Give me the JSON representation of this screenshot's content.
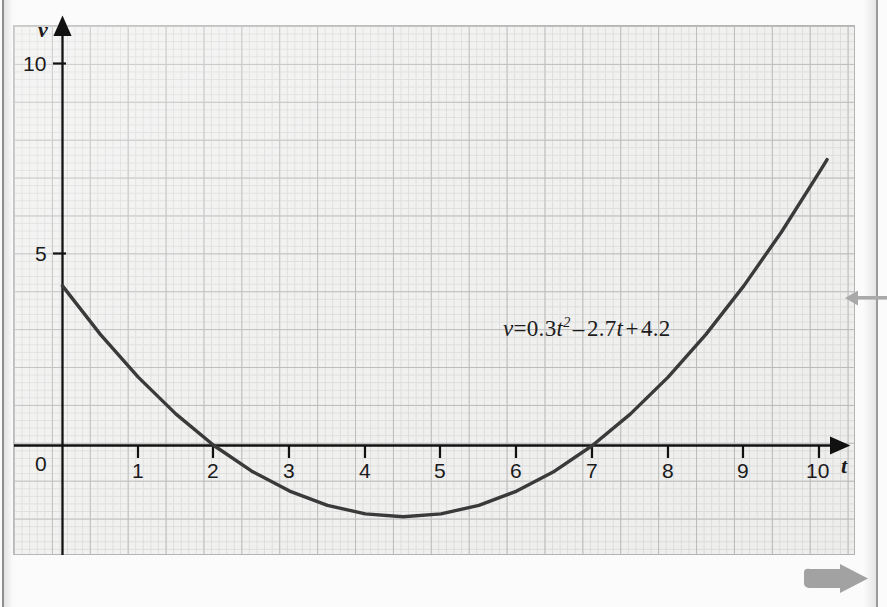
{
  "page": {
    "background_color": "#fbfbfb",
    "grid_color_major": "#bdbdbd",
    "grid_color_minor": "#dedede",
    "grid_background": "#f1f1f0",
    "curve_color": "#3a3a3a",
    "axis_color": "#111111",
    "marginal_arrow_color": "#a8a8a8"
  },
  "figure": {
    "equation_label": {
      "lhs": "v",
      "equals": "=",
      "term1_coeff": "0.3",
      "term1_var": "t",
      "term1_exp": "2",
      "op1": "–",
      "term2": "2.7",
      "term2_var": "t",
      "op2": "+",
      "term3": "4.2",
      "plain": "v = 0.3t² – 2.7t + 4.2"
    },
    "y_axis_name": "v",
    "x_axis_name": "t",
    "y_tick_labels": [
      "10",
      "5",
      "0"
    ],
    "x_tick_labels": [
      "1",
      "2",
      "3",
      "4",
      "5",
      "6",
      "7",
      "8",
      "9",
      "10"
    ],
    "origin_label": "0"
  },
  "chart_data": {
    "type": "line",
    "title": "",
    "subtitle": "",
    "xlabel": "t",
    "ylabel": "v",
    "grid": true,
    "legend": false,
    "annotations": [
      "v = 0.3t² – 2.7t + 4.2"
    ],
    "xlim": [
      -0.3,
      10.6
    ],
    "ylim": [
      -3.2,
      10.9
    ],
    "xticks": [
      0,
      1,
      2,
      3,
      4,
      5,
      6,
      7,
      8,
      9,
      10
    ],
    "yticks": [
      0,
      5,
      10
    ],
    "equation": "v = 0.3*t^2 - 2.7*t + 4.2",
    "roots": [
      2,
      7
    ],
    "vertex": {
      "t": 4.5,
      "v": -1.875
    },
    "y_intercept": 4.2,
    "x": [
      0,
      0.5,
      1,
      1.5,
      2,
      2.5,
      3,
      3.5,
      4,
      4.5,
      5,
      5.5,
      6,
      6.5,
      7,
      7.5,
      8,
      8.5,
      9,
      9.5,
      10,
      10.1
    ],
    "values": [
      4.2,
      2.925,
      1.8,
      0.825,
      0,
      -0.675,
      -1.2,
      -1.575,
      -1.8,
      -1.875,
      -1.8,
      -1.575,
      -1.2,
      -0.675,
      0,
      0.825,
      1.8,
      2.925,
      4.2,
      5.625,
      7.2,
      7.523
    ]
  },
  "margin_markers": {
    "pointer_left_arrow": "left-pointing-arrow",
    "forward_arrow": "forward-arrow"
  }
}
